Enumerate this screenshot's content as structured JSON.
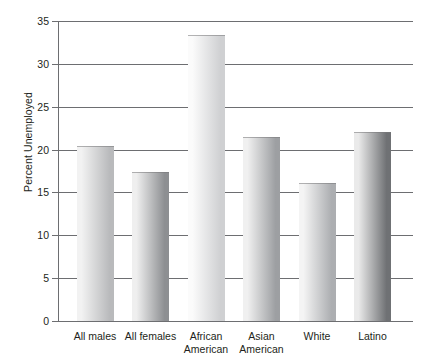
{
  "chart_data": {
    "type": "bar",
    "title": "",
    "xlabel": "",
    "ylabel": "Percent Unemployed",
    "ylim": [
      0,
      35
    ],
    "ytick_values": [
      0,
      5,
      10,
      15,
      20,
      25,
      30,
      35
    ],
    "ytick_labels": [
      "0",
      "5",
      "10",
      "15",
      "20",
      "25",
      "30",
      "35"
    ],
    "grid": true,
    "legend": false,
    "categories": [
      "All males",
      "All females",
      "African\nAmerican",
      "Asian\nAmerican",
      "White",
      "Latino"
    ],
    "values": [
      20.4,
      17.4,
      33.4,
      21.5,
      16.1,
      22.0
    ],
    "bar_colors": [
      {
        "left": "#f2f2f2",
        "right": "#b9babc"
      },
      {
        "left": "#efefef",
        "right": "#8d8f92"
      },
      {
        "left": "#fbfbfb",
        "right": "#cfd0d2"
      },
      {
        "left": "#f0f0f0",
        "right": "#9d9fa2"
      },
      {
        "left": "#f4f4f4",
        "right": "#acaeb1"
      },
      {
        "left": "#eaeaea",
        "right": "#6f7174"
      }
    ]
  },
  "axis": {
    "line_color": "#6d6e71",
    "text_color": "#231f20"
  }
}
